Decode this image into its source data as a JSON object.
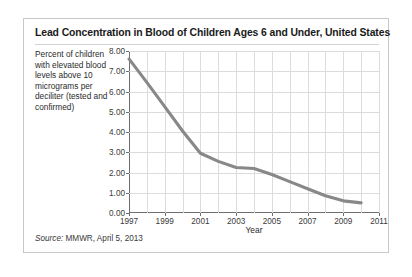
{
  "figure": {
    "title": "Lead Concentration in Blood of Children Ages 6 and Under, United States",
    "y_description": "Percent of children with elevated blood levels above 10 micrograms per deciliter (tested and confirmed)",
    "source_label": "Source:",
    "source_text": " MMWR, April 5, 2013",
    "line_color": "#888888",
    "grid_color": "#dcdcdc",
    "axis_color": "#6e6e6e",
    "border_color": "#c8c8c8"
  },
  "chart_data": {
    "type": "line",
    "title": "Lead Concentration in Blood of Children Ages 6 and Under, United States",
    "xlabel": "Year",
    "ylabel": "Percent of children with elevated blood levels above 10 micrograms per deciliter (tested and confirmed)",
    "xlim": [
      1997,
      2011
    ],
    "ylim": [
      0.0,
      8.0
    ],
    "grid": true,
    "legend": "none",
    "x_ticks": [
      "1997",
      "1999",
      "2001",
      "2003",
      "2005",
      "2007",
      "2009",
      "2011"
    ],
    "x_tick_values": [
      1997,
      1999,
      2001,
      2003,
      2005,
      2007,
      2009,
      2011
    ],
    "x_gridline_values": [
      1998,
      1999,
      2000,
      2001,
      2002,
      2003,
      2004,
      2005,
      2006,
      2007,
      2008,
      2009,
      2010,
      2011
    ],
    "y_ticks": [
      "0.00",
      "1.00",
      "2.00",
      "3.00",
      "4.00",
      "5.00",
      "6.00",
      "7.00",
      "8.00"
    ],
    "y_tick_values": [
      0.0,
      1.0,
      2.0,
      3.0,
      4.0,
      5.0,
      6.0,
      7.0,
      8.0
    ],
    "series": [
      {
        "name": "Percent of children with elevated blood lead levels",
        "x": [
          1997,
          1998,
          1999,
          2000,
          2001,
          2002,
          2003,
          2004,
          2005,
          2006,
          2007,
          2008,
          2009,
          2010
        ],
        "values": [
          7.61,
          6.45,
          5.25,
          4.05,
          2.95,
          2.55,
          2.25,
          2.2,
          1.9,
          1.55,
          1.2,
          0.85,
          0.6,
          0.5
        ]
      }
    ]
  }
}
